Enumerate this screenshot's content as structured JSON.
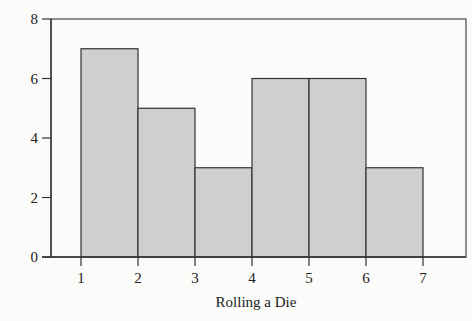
{
  "chart_data": {
    "type": "bar",
    "histogram": true,
    "title": "",
    "xlabel": "Rolling a Die",
    "ylabel": "",
    "bins": [
      {
        "from": 1,
        "to": 2,
        "value": 7
      },
      {
        "from": 2,
        "to": 3,
        "value": 5
      },
      {
        "from": 3,
        "to": 4,
        "value": 3
      },
      {
        "from": 4,
        "to": 5,
        "value": 6
      },
      {
        "from": 5,
        "to": 6,
        "value": 6
      },
      {
        "from": 6,
        "to": 7,
        "value": 3
      }
    ],
    "categories": [
      "1-2",
      "2-3",
      "3-4",
      "4-5",
      "5-6",
      "6-7"
    ],
    "values": [
      7,
      5,
      3,
      6,
      6,
      3
    ],
    "xticks": [
      "1",
      "2",
      "3",
      "4",
      "5",
      "6",
      "7"
    ],
    "yticks": [
      "0",
      "2",
      "4",
      "6",
      "8"
    ],
    "ylim": [
      0,
      8
    ],
    "xlim": [
      0.4,
      7.5
    ],
    "grid": false,
    "legend": null,
    "colors": {
      "bar_fill": "#cfcfcf",
      "bar_edge": "#333333",
      "background": "#fbfbfa"
    }
  }
}
